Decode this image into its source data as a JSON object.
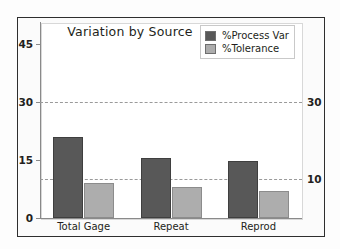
{
  "chart_data": {
    "type": "bar",
    "title": "Variation by Source",
    "xlabel": "",
    "ylabel": "",
    "categories": [
      "Total Gage",
      "Repeat",
      "Reprod"
    ],
    "series": [
      {
        "name": "%Process Var",
        "color": "#585858",
        "values": [
          21.0,
          15.5,
          14.8
        ]
      },
      {
        "name": "%Tolerance",
        "color": "#adadad",
        "values": [
          9.0,
          8.0,
          7.0
        ]
      }
    ],
    "ylim": [
      0,
      50
    ],
    "yticks": [
      0,
      15,
      30,
      45
    ],
    "right_axis": {
      "ticks": [
        10,
        30
      ],
      "reference_lines": [
        10,
        30
      ]
    },
    "grid": false,
    "legend_position": "top-right"
  },
  "axis": {
    "left_ticks": [
      "45",
      "30",
      "15",
      "0"
    ],
    "right_ticks": [
      "30",
      "10"
    ]
  },
  "legend": {
    "items": [
      {
        "label": "%Process Var"
      },
      {
        "label": "%Tolerance"
      }
    ]
  },
  "colors": {
    "process_var": "#585858",
    "tolerance": "#adadad",
    "frame": "#2e2e2e",
    "axis": "#8a8a8a",
    "refline": "#9a9a9a",
    "text": "#231f20"
  }
}
